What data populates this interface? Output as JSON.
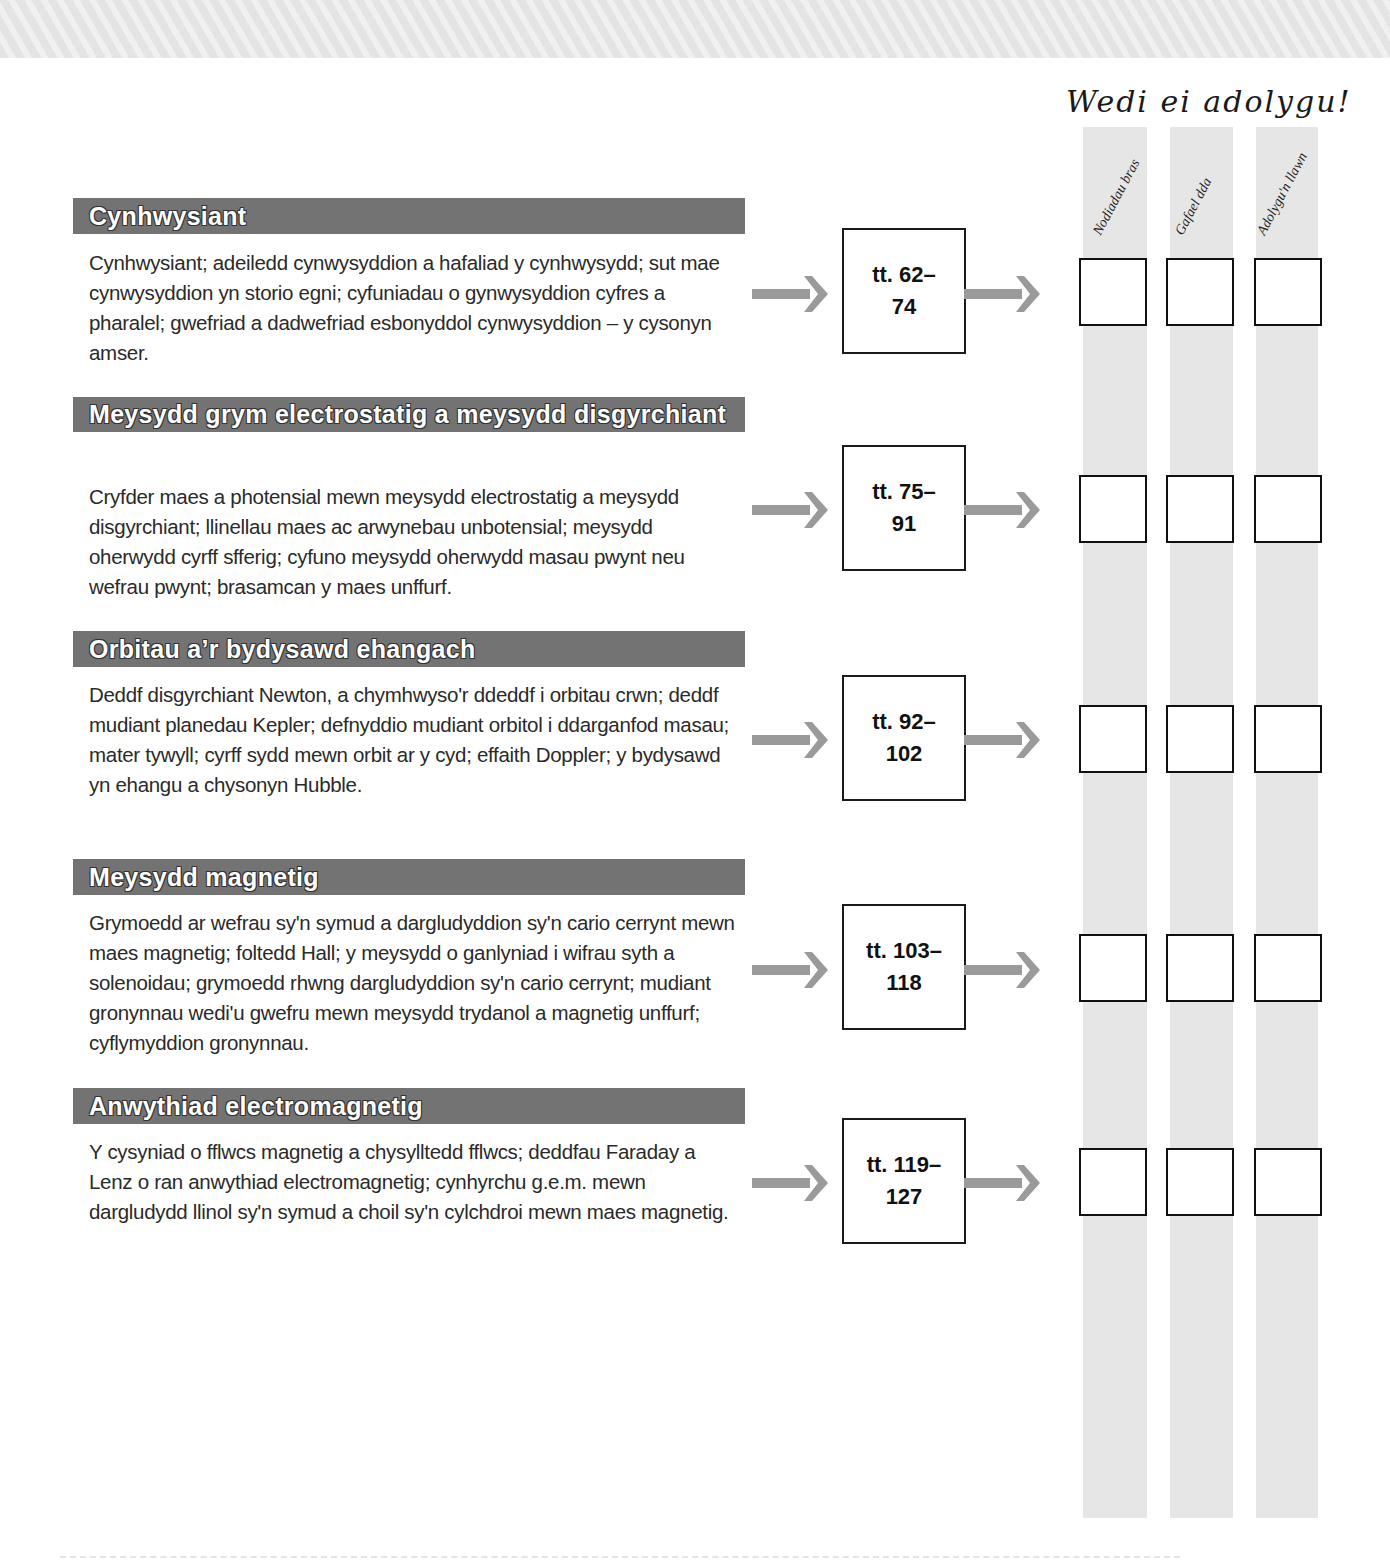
{
  "header": {
    "revised_title": "Wedi ei adolygu!",
    "columns": [
      {
        "label": "Nodiadau bras"
      },
      {
        "label": "Gafael dda"
      },
      {
        "label": "Adolygu'n llawn"
      }
    ]
  },
  "sections": [
    {
      "title": "Cynhwysiant",
      "body": "Cynhwysiant; adeiledd cynwysyddion a hafaliad y cynhwysydd; sut mae cynwysyddion yn storio egni; cyfuniadau o gynwysyddion cyfres a pharalel; gwefriad a dadwefriad esbonyddol cynwysyddion – y cysonyn amser.",
      "pages_line1": "tt. 62–",
      "pages_line2": "74"
    },
    {
      "title": "Meysydd grym electrostatig a meysydd disgyrchiant",
      "body": "Cryfder maes a photensial mewn meysydd electrostatig a meysydd disgyrchiant; llinellau maes ac arwynebau unbotensial; meysydd oherwydd cyrff sfferig; cyfuno meysydd oherwydd masau pwynt neu wefrau pwynt; brasamcan y maes unffurf.",
      "pages_line1": "tt. 75–",
      "pages_line2": "91"
    },
    {
      "title": "Orbitau a’r bydysawd ehangach",
      "body": "Deddf disgyrchiant Newton, a chymhwyso'r ddeddf i orbitau crwn; deddf mudiant planedau Kepler; defnyddio mudiant orbitol i ddarganfod masau; mater tywyll; cyrff sydd mewn orbit ar y cyd; effaith Doppler; y bydysawd yn ehangu a chysonyn Hubble.",
      "pages_line1": "tt. 92–",
      "pages_line2": "102"
    },
    {
      "title": "Meysydd magnetig",
      "body": "Grymoedd ar wefrau sy'n symud a dargludyddion sy'n cario cerrynt mewn maes magnetig; foltedd Hall; y meysydd o ganlyniad i wifrau syth a solenoidau; grymoedd rhwng dargludyddion sy'n cario cerrynt; mudiant gronynnau wedi'u gwefru mewn meysydd trydanol a magnetig unffurf; cyflymyddion gronynnau.",
      "pages_line1": "tt. 103–",
      "pages_line2": "118"
    },
    {
      "title": "Anwythiad electromagnetig",
      "body": "Y cysyniad o fflwcs magnetig a chysylltedd fflwcs; deddfau Faraday a Lenz o ran anwythiad electromagnetig; cynhyrchu g.e.m. mewn dargludydd llinol sy'n symud a choil sy'n cylchdroi mewn maes magnetig.",
      "pages_line1": "tt. 119–",
      "pages_line2": "127"
    }
  ],
  "colors": {
    "header_bar": "#737373",
    "arrow": "#9a9a9a",
    "strip": "#e6e6e6",
    "box_border": "#1a1a1a"
  }
}
